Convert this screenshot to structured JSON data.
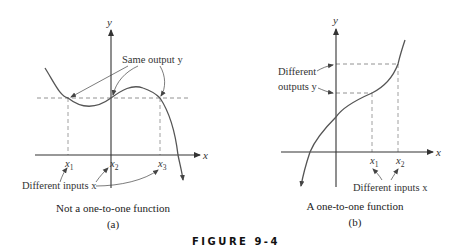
{
  "figure": {
    "label": "FIGURE 9-4"
  },
  "panel_a": {
    "axis_x_label": "x",
    "axis_y_label": "y",
    "annotation_top": "Same output y",
    "annotation_bottom": "Different inputs x",
    "ticks": [
      "x1",
      "x2",
      "x3"
    ],
    "tick_base": "x",
    "tick_subs": [
      "1",
      "2",
      "3"
    ],
    "caption": "Not a one-to-one function",
    "sublabel": "(a)"
  },
  "panel_b": {
    "axis_x_label": "x",
    "axis_y_label": "y",
    "annotation_left_line1": "Different",
    "annotation_left_line2": "outputs y",
    "annotation_bottom": "Different inputs x",
    "ticks": [
      "x1",
      "x2"
    ],
    "tick_base": "x",
    "tick_subs": [
      "1",
      "2"
    ],
    "caption": "A one-to-one function",
    "sublabel": "(b)"
  },
  "colors": {
    "axis": "#333333",
    "curve": "#555555",
    "dashed": "#777777",
    "text": "#333333"
  }
}
